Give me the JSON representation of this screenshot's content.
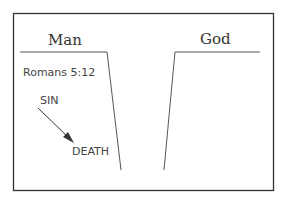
{
  "diagram": {
    "left_side": {
      "heading": "Man",
      "reference": "Romans 5:12"
    },
    "right_side": {
      "heading": "God"
    },
    "flow": {
      "from": "SIN",
      "to": "DEATH"
    },
    "colors": {
      "frame": "#333333",
      "line": "#555555",
      "text": "#333333"
    }
  }
}
